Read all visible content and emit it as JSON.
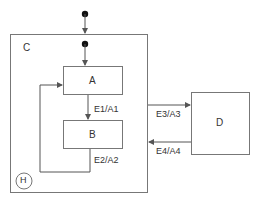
{
  "diagram": {
    "type": "statechart",
    "composite_state": {
      "name": "C",
      "history": "H"
    },
    "states": [
      {
        "id": "A",
        "label": "A"
      },
      {
        "id": "B",
        "label": "B"
      },
      {
        "id": "D",
        "label": "D"
      }
    ],
    "transitions": [
      {
        "from": "A",
        "to": "B",
        "label": "E1/A1"
      },
      {
        "from": "B",
        "to": "A",
        "label": "E2/A2"
      },
      {
        "from": "C",
        "to": "D",
        "label": "E3/A3"
      },
      {
        "from": "D",
        "to": "C",
        "label": "E4/A4"
      }
    ],
    "colors": {
      "line": "#555555",
      "text": "#333333",
      "background": "#ffffff"
    }
  }
}
